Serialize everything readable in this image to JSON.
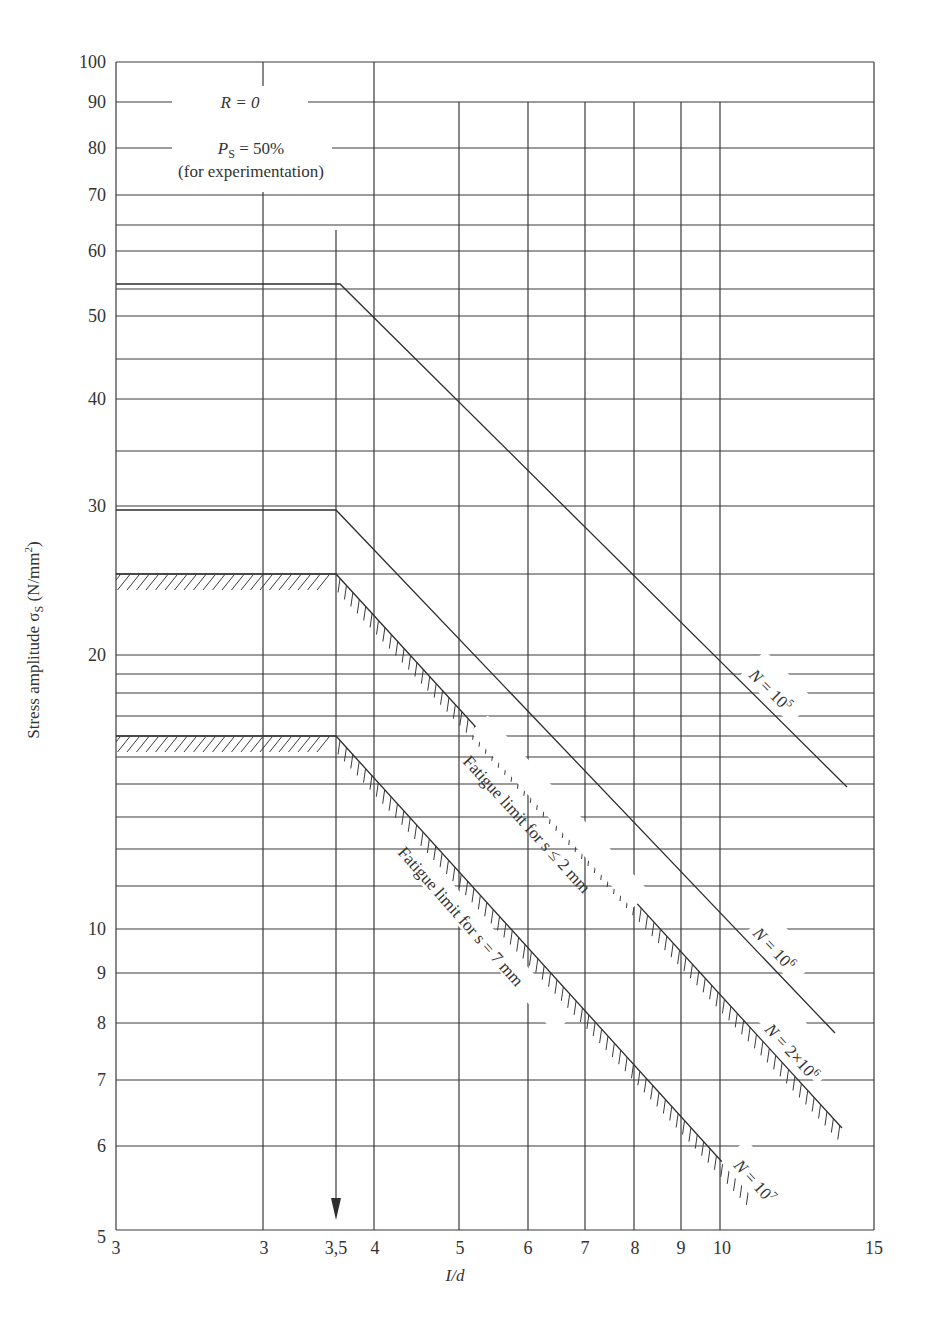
{
  "chart_data": {
    "type": "line",
    "title": "",
    "xlabel": "I/d",
    "ylabel": "Stress amplitude σS (N/mm²)",
    "ylabel_parts": {
      "main": "Stress amplitude σ",
      "sub": "S",
      "unit_pre": " (N/mm",
      "sup": "2",
      "unit_post": ")"
    },
    "xscale": "log",
    "yscale": "log",
    "xlim": [
      3,
      15
    ],
    "ylim": [
      5,
      100
    ],
    "grid": true,
    "x_tick_labels": [
      "3",
      "3",
      "3,5",
      "4",
      "5",
      "6",
      "7",
      "8",
      "9",
      "10",
      "15"
    ],
    "y_tick_labels": [
      "100",
      "90",
      "80",
      "70",
      "60",
      "50",
      "40",
      "30",
      "20",
      "10",
      "9",
      "8",
      "7",
      "6",
      "5"
    ],
    "annotations": {
      "r_ratio": "R = 0",
      "ps_main": "P",
      "ps_sub": "S",
      "ps_value": " = 50%",
      "ps_note": "(for experimentation)",
      "arrow_at_x": "3,5"
    },
    "series": [
      {
        "name": "N = 10^5",
        "label_pre": "N",
        "label_mid": " = 10",
        "label_sup": "5",
        "hatched": false,
        "points": [
          [
            3,
            55
          ],
          [
            3.5,
            55
          ],
          [
            5,
            40
          ],
          [
            14.5,
            14.5
          ]
        ]
      },
      {
        "name": "N = 10^6",
        "label_pre": "N",
        "label_mid": " = 10",
        "label_sup": "6",
        "hatched": false,
        "points": [
          [
            3,
            29.7
          ],
          [
            3.5,
            29.7
          ],
          [
            5,
            22
          ],
          [
            14,
            7.8
          ]
        ]
      },
      {
        "name": "N = 2×10^6 (Fatigue limit for s ≤ 2 mm)",
        "label_pre": "N",
        "label_mid": " = 2×10",
        "label_sup": "6",
        "hatched": true,
        "band_label": "Fatigue limit for s ≤ 2 mm",
        "points": [
          [
            3,
            25
          ],
          [
            3.5,
            25
          ],
          [
            14.5,
            6.2
          ]
        ]
      },
      {
        "name": "N = 10^7 (Fatigue limit for s = 7 mm)",
        "label_pre": "N",
        "label_mid": " = 10",
        "label_sup": "7",
        "hatched": true,
        "band_label": "Fatigue limit for s = 7 mm",
        "points": [
          [
            3,
            16
          ],
          [
            3.5,
            16
          ],
          [
            11,
            5.3
          ]
        ]
      }
    ]
  },
  "axes": {
    "x_label": "I/d",
    "y_label": "Stress amplitude σS (N/mm²)"
  }
}
